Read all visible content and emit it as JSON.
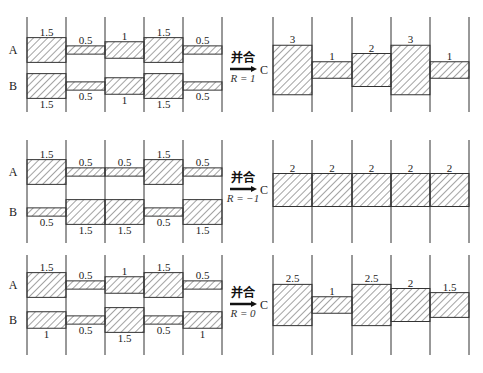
{
  "operation_label": "并合",
  "panels": [
    {
      "name": "R=1",
      "A_label": "A",
      "B_label": "B",
      "C_label": "C",
      "R_text": "R = 1",
      "A": [
        1.5,
        0.5,
        1,
        1.5,
        0.5
      ],
      "A_labels": [
        "1.5",
        "0.5",
        "1",
        "1.5",
        "0.5"
      ],
      "B": [
        1.5,
        0.5,
        1,
        1.5,
        0.5
      ],
      "B_labels": [
        "1.5",
        "0.5",
        "1",
        "1.5",
        "0.5"
      ],
      "C": [
        3,
        1,
        2,
        3,
        1
      ],
      "C_labels": [
        "3",
        "1",
        "2",
        "3",
        "1"
      ]
    },
    {
      "name": "R=-1",
      "A_label": "A",
      "B_label": "B",
      "C_label": "C",
      "R_text": "R = −1",
      "A": [
        1.5,
        0.5,
        0.5,
        1.5,
        0.5
      ],
      "A_labels": [
        "1.5",
        "0.5",
        "0.5",
        "1.5",
        "0.5"
      ],
      "B": [
        0.5,
        1.5,
        1.5,
        0.5,
        1.5
      ],
      "B_labels": [
        "0.5",
        "1.5",
        "1.5",
        "0.5",
        "1.5"
      ],
      "C": [
        2,
        2,
        2,
        2,
        2
      ],
      "C_labels": [
        "2",
        "2",
        "2",
        "2",
        "2"
      ]
    },
    {
      "name": "R=0",
      "A_label": "A",
      "B_label": "B",
      "C_label": "C",
      "R_text": "R = 0",
      "A": [
        1.5,
        0.5,
        1,
        1.5,
        0.5
      ],
      "A_labels": [
        "1.5",
        "0.5",
        "1",
        "1.5",
        "0.5"
      ],
      "B": [
        1,
        0.5,
        1.5,
        0.5,
        1
      ],
      "B_labels": [
        "1",
        "0.5",
        "1.5",
        "0.5",
        "1"
      ],
      "C": [
        2.5,
        1,
        2.5,
        2,
        1.5
      ],
      "C_labels": [
        "2.5",
        "1",
        "2.5",
        "2",
        "1.5"
      ]
    }
  ],
  "colors": {
    "line": "#333333",
    "hatch": "#333333",
    "background": "#ffffff"
  }
}
